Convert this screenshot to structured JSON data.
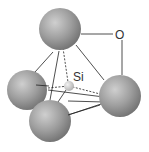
{
  "diagram": {
    "labels": {
      "oxygen": "O",
      "silicon": "Si"
    },
    "colors": {
      "sphere_light": "#c9c9c9",
      "sphere_mid": "#9a9a9a",
      "sphere_dark": "#6e6e6e",
      "si_light": "#f0f0f0",
      "si_dark": "#b5b5b5",
      "line": "#222222"
    }
  }
}
